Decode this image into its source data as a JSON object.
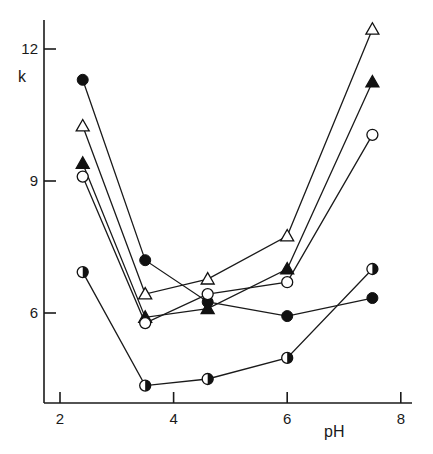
{
  "chart_data": {
    "type": "line",
    "title": "",
    "xlabel": "pH",
    "ylabel": "k",
    "xlim": [
      1.7,
      8.2
    ],
    "ylim": [
      3.98,
      13.2
    ],
    "xticks": [
      2,
      4,
      6,
      8
    ],
    "yticks": [
      6,
      9,
      12
    ],
    "grid": false,
    "legend": "none",
    "x": [
      2.4,
      3.5,
      4.6,
      6.0,
      7.5
    ],
    "series": [
      {
        "name": "filled circle",
        "marker": "filled-circle",
        "x": [
          2.4,
          3.5,
          4.6,
          6.0,
          7.5
        ],
        "values": [
          11.3,
          7.2,
          6.25,
          5.93,
          6.34
        ]
      },
      {
        "name": "open triangle",
        "marker": "open-triangle",
        "x": [
          2.4,
          3.5,
          4.6,
          6.0,
          7.5
        ],
        "values": [
          10.25,
          6.43,
          6.77,
          7.75,
          12.45
        ]
      },
      {
        "name": "filled triangle",
        "marker": "filled-triangle",
        "x": [
          2.4,
          3.5,
          4.6,
          6.0,
          7.5
        ],
        "values": [
          9.4,
          5.9,
          6.1,
          7.0,
          11.25
        ]
      },
      {
        "name": "open circle",
        "marker": "open-circle",
        "x": [
          2.4,
          3.5,
          4.6,
          6.0,
          7.5
        ],
        "values": [
          9.1,
          5.77,
          6.43,
          6.7,
          10.05
        ]
      },
      {
        "name": "half-filled circle",
        "marker": "half-circle",
        "x": [
          2.4,
          3.5,
          4.6,
          6.0,
          7.5
        ],
        "values": [
          6.93,
          4.35,
          4.5,
          4.98,
          7.0
        ]
      }
    ]
  },
  "axes": {
    "x_label": "pH",
    "y_label": "k",
    "x_tick_labels": [
      "2",
      "4",
      "6",
      "8"
    ],
    "y_tick_labels": [
      "6",
      "9",
      "12"
    ]
  }
}
